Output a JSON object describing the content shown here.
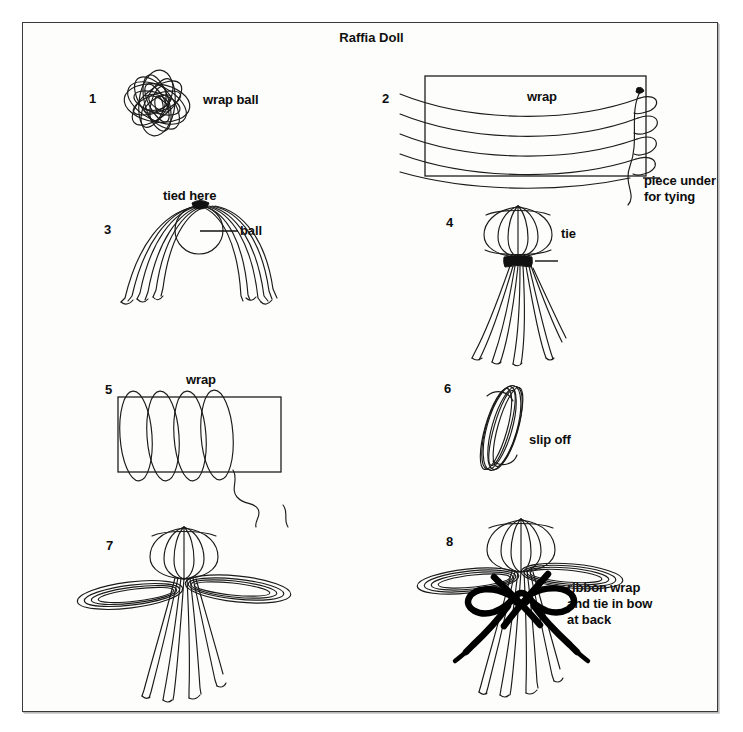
{
  "document": {
    "title": "Raffia Doll",
    "background_color": "#ffffff",
    "paper_color": "#fdfdfc",
    "ink_color": "#1a1a1a",
    "border_color": "#3a3a3a"
  },
  "steps": [
    {
      "number": "1",
      "label": "wrap ball",
      "icon": "raffia-ball-coil"
    },
    {
      "number": "2",
      "label": "wrap",
      "note": "piece under\nfor tying",
      "icon": "rectangle-with-horizontal-wraps"
    },
    {
      "number": "3",
      "label": "tied here",
      "label2": "ball",
      "icon": "arched-strands-over-ball"
    },
    {
      "number": "4",
      "label": "tie",
      "icon": "doll-head-with-hanging-strands"
    },
    {
      "number": "5",
      "label": "wrap",
      "icon": "rectangle-with-vertical-wraps"
    },
    {
      "number": "6",
      "label": "slip off",
      "icon": "tilted-coil-loop"
    },
    {
      "number": "7",
      "label": "",
      "icon": "doll-with-arms"
    },
    {
      "number": "8",
      "label": "ribbon wrap\nand tie in bow\nat back",
      "icon": "doll-with-ribbon-bow"
    }
  ]
}
